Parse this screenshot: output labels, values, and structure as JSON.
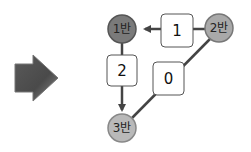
{
  "diagram": {
    "arrow_icon": "right-arrow-icon",
    "nodes": [
      {
        "id": "n1",
        "label": "1반",
        "fill": "#7a7a7a"
      },
      {
        "id": "n2",
        "label": "2반",
        "fill": "#a9a9a9"
      },
      {
        "id": "n3",
        "label": "3반",
        "fill": "#b9b9b9"
      }
    ],
    "edges": [
      {
        "from": "2반",
        "to": "1반",
        "weight": "1",
        "directed": true
      },
      {
        "from": "1반",
        "to": "3반",
        "weight": "2",
        "directed": true
      },
      {
        "from": "2반",
        "to": "3반",
        "weight": "0",
        "directed": false
      }
    ]
  }
}
